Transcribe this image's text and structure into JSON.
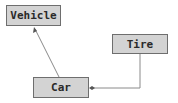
{
  "diagram": {
    "nodes": [
      {
        "id": "vehicle",
        "label": "Vehicle"
      },
      {
        "id": "tire",
        "label": "Tire"
      },
      {
        "id": "car",
        "label": "Car"
      }
    ],
    "edges": [
      {
        "from": "car",
        "to": "vehicle",
        "type": "generalization-arrow"
      },
      {
        "from": "tire",
        "to": "car",
        "type": "aggregation"
      }
    ],
    "colors": {
      "box_fill": "#d3d3d3",
      "box_border": "#6e6e6e",
      "line": "#8a8a8a"
    }
  }
}
